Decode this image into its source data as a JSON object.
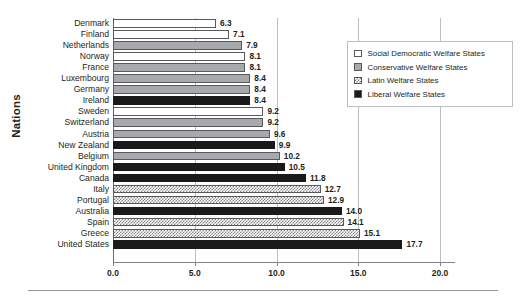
{
  "chart_data": {
    "type": "bar",
    "orientation": "horizontal",
    "title": "",
    "xlabel": "",
    "ylabel": "Nations",
    "xlim": [
      0.0,
      20.0
    ],
    "xticks": [
      "0.0",
      "5.0",
      "10.0",
      "15.0",
      "20.0"
    ],
    "xtick_values": [
      0.0,
      5.0,
      10.0,
      15.0,
      20.0
    ],
    "grid": true,
    "grid_axis": "x",
    "legend_position": "top-right",
    "categories": [
      "Denmark",
      "Finland",
      "Netherlands",
      "Norway",
      "France",
      "Luxembourg",
      "Germany",
      "Ireland",
      "Sweden",
      "Switzerland",
      "Austria",
      "New Zealand",
      "Belgium",
      "United Kingdom",
      "Canada",
      "Italy",
      "Portugal",
      "Australia",
      "Spain",
      "Greece",
      "United States"
    ],
    "values": [
      6.3,
      7.1,
      7.9,
      8.1,
      8.1,
      8.4,
      8.4,
      8.4,
      9.2,
      9.2,
      9.6,
      9.9,
      10.2,
      10.5,
      11.8,
      12.7,
      12.9,
      14.0,
      14.1,
      15.1,
      17.7
    ],
    "value_labels": [
      "6.3",
      "7.1",
      "7.9",
      "8.1",
      "8.1",
      "8.4",
      "8.4",
      "8.4",
      "9.2",
      "9.2",
      "9.6",
      "9.9",
      "10.2",
      "10.5",
      "11.8",
      "12.7",
      "12.9",
      "14.0",
      "14.1",
      "15.1",
      "17.7"
    ],
    "groups": [
      "social-democratic",
      "social-democratic",
      "conservative",
      "social-democratic",
      "conservative",
      "conservative",
      "conservative",
      "liberal",
      "social-democratic",
      "conservative",
      "conservative",
      "liberal",
      "conservative",
      "liberal",
      "liberal",
      "latin",
      "latin",
      "liberal",
      "latin",
      "latin",
      "liberal"
    ],
    "legend": [
      {
        "label": "Social Democratic Welfare States",
        "key": "social-democratic",
        "fill": "#ffffff"
      },
      {
        "label": "Conservative Welfare States",
        "key": "conservative",
        "fill": "#a7a9ac"
      },
      {
        "label": "Latin Welfare States",
        "key": "latin",
        "fill": "#808285"
      },
      {
        "label": "Liberal Welfare States",
        "key": "liberal",
        "fill": "#1a1a1a"
      }
    ]
  },
  "colors": {
    "social_democratic": "#ffffff",
    "conservative": "#a7a9ac",
    "latin": "#808285",
    "liberal": "#1a1a1a",
    "axis": "#6d6e71",
    "grid": "#bcbec0",
    "text": "#231f20",
    "background": "#ffffff"
  }
}
